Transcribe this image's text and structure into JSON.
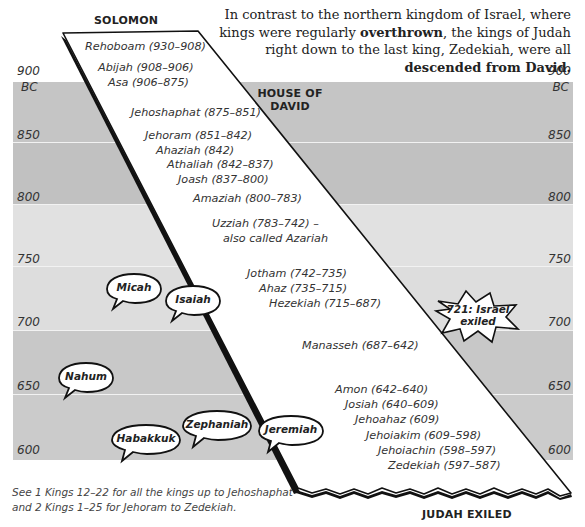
{
  "intro": {
    "part1": "In contrast to the northern kingdom of Israel, where kings were regularly ",
    "bold1": "overthrown",
    "part2": ", the kings of Judah right down to the last king, Zedekiah, were all ",
    "bold2": "descended from David",
    "part3": "."
  },
  "labels": {
    "top": "SOLOMON",
    "house_line1": "HOUSE OF",
    "house_line2": "DAVID",
    "bottom": "JUDAH EXILED"
  },
  "timeline": {
    "unit": "BC",
    "years": [
      "900",
      "850",
      "800",
      "750",
      "700",
      "650",
      "600"
    ],
    "band_colors": [
      "#c5c5c5",
      "#c1c1c1",
      "#e1e1e1",
      "#dddddd",
      "#c8c8c8",
      "#cbcbcb"
    ]
  },
  "kings": [
    {
      "name": "Rehoboam (930–908)"
    },
    {
      "name": "Abijah (908–906)"
    },
    {
      "name": "Asa (906–875)"
    },
    {
      "name": "Jehoshaphat (875–851)"
    },
    {
      "name": "Jehoram (851–842)"
    },
    {
      "name": "Ahaziah (842)"
    },
    {
      "name": "Athaliah (842–837)"
    },
    {
      "name": "Joash (837–800)"
    },
    {
      "name": "Amaziah (800–783)"
    },
    {
      "name": "Uzziah (783–742) –"
    },
    {
      "name": "also called Azariah"
    },
    {
      "name": "Jotham (742–735)"
    },
    {
      "name": "Ahaz (735–715)"
    },
    {
      "name": "Hezekiah (715–687)"
    },
    {
      "name": "Manasseh (687–642)"
    },
    {
      "name": "Amon (642–640)"
    },
    {
      "name": "Josiah (640–609)"
    },
    {
      "name": "Jehoahaz (609)"
    },
    {
      "name": "Jehoiakim (609–598)"
    },
    {
      "name": "Jehoiachin (598–597)"
    },
    {
      "name": "Zedekiah (597–587)"
    }
  ],
  "prophets": [
    "Micah",
    "Isaiah",
    "Nahum",
    "Zephaniah",
    "Habakkuk",
    "Jeremiah"
  ],
  "event": {
    "line1": "721: Israel",
    "line2": "exiled"
  },
  "footnote": {
    "line1": "See 1 Kings 12–22 for all the kings up to Jehoshaphat",
    "line2": "and 2 Kings 1–25 for Jehoram to Zedekiah."
  }
}
